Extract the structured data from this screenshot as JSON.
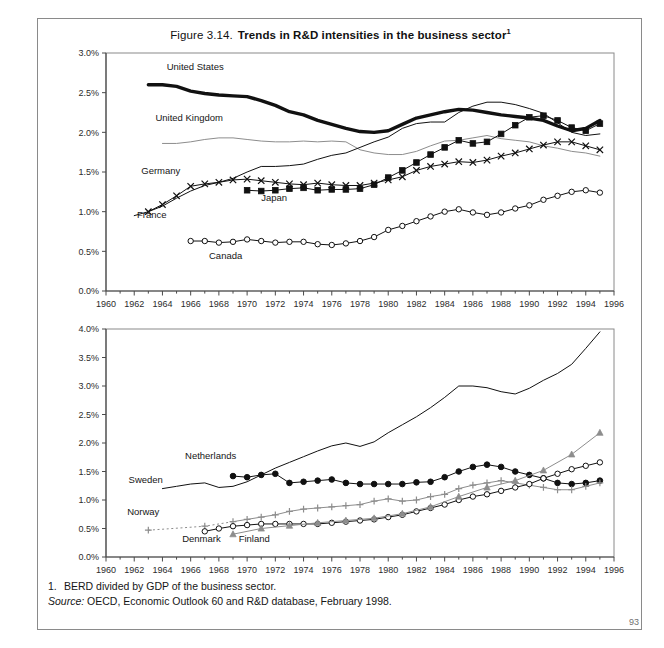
{
  "figure": {
    "number": "Figure 3.14.",
    "title": "Trends in R&D intensities in the business sector",
    "title_superscript": "1"
  },
  "footnotes": {
    "note_marker": "1.",
    "note_text": "BERD divided by GDP of the business sector.",
    "source_word": "Source:",
    "source_text": "OECD, Economic Outlook 60 and R&D database, February 1998."
  },
  "page_number": "93",
  "colors": {
    "axis": "#4a4a4a",
    "frame": "#8a8a8a",
    "black": "#111111",
    "gray": "#8d8d8d",
    "midgray": "#6e6e6e",
    "text": "#161616"
  },
  "chart_data": [
    {
      "type": "line",
      "id": "top-panel",
      "title": "Trends in R&D intensities in the business sector",
      "xlabel": "",
      "ylabel": "",
      "xlim": [
        1960,
        1996
      ],
      "ylim": [
        0.0,
        3.0
      ],
      "xticks": [
        1960,
        1962,
        1964,
        1966,
        1968,
        1970,
        1972,
        1974,
        1976,
        1978,
        1980,
        1982,
        1984,
        1986,
        1988,
        1990,
        1992,
        1994,
        1996
      ],
      "yticks": [
        "0.0%",
        "0.5%",
        "1.0%",
        "1.5%",
        "2.0%",
        "2.5%",
        "3.0%"
      ],
      "grid": false,
      "legend": "inline-annotations",
      "series": [
        {
          "name": "United States",
          "style": "thick-black-line",
          "marker": "none",
          "label_x": 1964.3,
          "label_y": 2.78,
          "x": [
            1963,
            1964,
            1965,
            1966,
            1967,
            1968,
            1969,
            1970,
            1971,
            1972,
            1973,
            1974,
            1975,
            1976,
            1977,
            1978,
            1979,
            1980,
            1981,
            1982,
            1983,
            1984,
            1985,
            1986,
            1987,
            1988,
            1989,
            1990,
            1991,
            1992,
            1993,
            1994,
            1995
          ],
          "values": [
            2.6,
            2.6,
            2.58,
            2.52,
            2.49,
            2.47,
            2.46,
            2.45,
            2.4,
            2.34,
            2.26,
            2.22,
            2.15,
            2.1,
            2.05,
            2.01,
            2.0,
            2.02,
            2.1,
            2.18,
            2.22,
            2.26,
            2.29,
            2.28,
            2.25,
            2.22,
            2.2,
            2.18,
            2.15,
            2.08,
            2.02,
            2.05,
            2.15
          ]
        },
        {
          "name": "United Kingdom",
          "style": "gray-line",
          "marker": "none",
          "label_x": 1963.5,
          "label_y": 2.14,
          "x": [
            1964,
            1965,
            1966,
            1967,
            1968,
            1969,
            1970,
            1971,
            1972,
            1973,
            1974,
            1975,
            1976,
            1977,
            1978,
            1979,
            1980,
            1981,
            1982,
            1983,
            1984,
            1985,
            1986,
            1987,
            1988,
            1989,
            1990,
            1991,
            1992,
            1993,
            1994,
            1995
          ],
          "values": [
            1.86,
            1.86,
            1.88,
            1.91,
            1.93,
            1.93,
            1.91,
            1.89,
            1.88,
            1.88,
            1.89,
            1.88,
            1.89,
            1.88,
            1.78,
            1.74,
            1.72,
            1.72,
            1.76,
            1.83,
            1.89,
            1.9,
            1.93,
            1.96,
            1.92,
            1.9,
            1.88,
            1.83,
            1.8,
            1.76,
            1.74,
            1.7
          ]
        },
        {
          "name": "Germany",
          "style": "thin-black-line",
          "marker": "none",
          "label_x": 1962.5,
          "label_y": 1.48,
          "x": [
            1962,
            1963,
            1964,
            1965,
            1966,
            1967,
            1968,
            1969,
            1970,
            1971,
            1972,
            1973,
            1974,
            1975,
            1976,
            1977,
            1978,
            1979,
            1980,
            1981,
            1982,
            1983,
            1984,
            1985,
            1986,
            1987,
            1988,
            1989,
            1990,
            1991,
            1992,
            1993,
            1994,
            1995
          ],
          "values": [
            0.95,
            1.0,
            1.07,
            1.17,
            1.26,
            1.33,
            1.37,
            1.42,
            1.5,
            1.57,
            1.57,
            1.58,
            1.6,
            1.66,
            1.71,
            1.74,
            1.81,
            1.88,
            1.94,
            2.05,
            2.11,
            2.13,
            2.13,
            2.25,
            2.33,
            2.38,
            2.38,
            2.35,
            2.3,
            2.24,
            2.12,
            2.0,
            1.96,
            1.98
          ]
        },
        {
          "name": "France",
          "style": "thin-black-line",
          "marker": "cross",
          "label_x": 1962.2,
          "label_y": 0.92,
          "x": [
            1963,
            1964,
            1965,
            1966,
            1967,
            1968,
            1969,
            1970,
            1971,
            1972,
            1973,
            1974,
            1975,
            1976,
            1977,
            1978,
            1979,
            1980,
            1981,
            1982,
            1983,
            1984,
            1985,
            1986,
            1987,
            1988,
            1989,
            1990,
            1991,
            1992,
            1993,
            1994,
            1995
          ],
          "values": [
            1.0,
            1.09,
            1.2,
            1.32,
            1.35,
            1.37,
            1.4,
            1.41,
            1.39,
            1.37,
            1.35,
            1.34,
            1.36,
            1.34,
            1.33,
            1.33,
            1.36,
            1.4,
            1.44,
            1.52,
            1.57,
            1.6,
            1.63,
            1.62,
            1.65,
            1.7,
            1.74,
            1.79,
            1.84,
            1.88,
            1.88,
            1.83,
            1.78
          ]
        },
        {
          "name": "Japan",
          "style": "thin-black-line",
          "marker": "filled-square",
          "label_x": 1971.0,
          "label_y": 1.13,
          "x": [
            1970,
            1971,
            1972,
            1973,
            1974,
            1975,
            1976,
            1977,
            1978,
            1979,
            1980,
            1981,
            1982,
            1983,
            1984,
            1985,
            1986,
            1987,
            1988,
            1989,
            1990,
            1991,
            1992,
            1993,
            1994,
            1995
          ],
          "values": [
            1.27,
            1.26,
            1.27,
            1.29,
            1.3,
            1.27,
            1.28,
            1.28,
            1.29,
            1.34,
            1.43,
            1.52,
            1.62,
            1.72,
            1.81,
            1.9,
            1.86,
            1.88,
            1.98,
            2.09,
            2.19,
            2.21,
            2.15,
            2.06,
            2.02,
            2.11
          ]
        },
        {
          "name": "Canada",
          "style": "thin-black-line",
          "marker": "open-circle",
          "label_x": 1967.3,
          "label_y": 0.4,
          "x": [
            1966,
            1967,
            1968,
            1969,
            1970,
            1971,
            1972,
            1973,
            1974,
            1975,
            1976,
            1977,
            1978,
            1979,
            1980,
            1981,
            1982,
            1983,
            1984,
            1985,
            1986,
            1987,
            1988,
            1989,
            1990,
            1991,
            1992,
            1993,
            1994,
            1995
          ],
          "values": [
            0.63,
            0.63,
            0.61,
            0.62,
            0.65,
            0.63,
            0.61,
            0.62,
            0.62,
            0.59,
            0.58,
            0.6,
            0.63,
            0.68,
            0.77,
            0.82,
            0.88,
            0.94,
            1.0,
            1.03,
            0.99,
            0.96,
            0.99,
            1.04,
            1.08,
            1.15,
            1.2,
            1.25,
            1.27,
            1.24
          ]
        }
      ]
    },
    {
      "type": "line",
      "id": "bottom-panel",
      "title": "",
      "xlabel": "",
      "ylabel": "",
      "xlim": [
        1960,
        1996
      ],
      "ylim": [
        0.0,
        4.0
      ],
      "xticks": [
        1960,
        1962,
        1964,
        1966,
        1968,
        1970,
        1972,
        1974,
        1976,
        1978,
        1980,
        1982,
        1984,
        1986,
        1988,
        1990,
        1992,
        1994,
        1996
      ],
      "yticks": [
        "0.0%",
        "0.5%",
        "1.0%",
        "1.5%",
        "2.0%",
        "2.5%",
        "3.0%",
        "3.5%",
        "4.0%"
      ],
      "grid": false,
      "legend": "inline-annotations",
      "series": [
        {
          "name": "Sweden",
          "style": "thin-black-line",
          "marker": "none",
          "label_x": 1961.6,
          "label_y": 1.3,
          "x": [
            1964,
            1965,
            1966,
            1967,
            1968,
            1969,
            1970,
            1971,
            1972,
            1973,
            1974,
            1975,
            1976,
            1977,
            1978,
            1979,
            1980,
            1981,
            1982,
            1983,
            1984,
            1985,
            1986,
            1987,
            1988,
            1989,
            1990,
            1991,
            1992,
            1993,
            1994,
            1995
          ],
          "values": [
            1.2,
            1.24,
            1.28,
            1.3,
            1.22,
            1.24,
            1.32,
            1.44,
            1.56,
            1.66,
            1.76,
            1.86,
            1.95,
            2.0,
            1.94,
            2.02,
            2.18,
            2.32,
            2.46,
            2.62,
            2.8,
            3.0,
            3.0,
            2.97,
            2.9,
            2.86,
            2.96,
            3.1,
            3.22,
            3.38,
            3.66,
            3.95
          ]
        },
        {
          "name": "Netherlands",
          "style": "thin-black-line",
          "marker": "filled-circle",
          "label_x": 1965.6,
          "label_y": 1.72,
          "x": [
            1969,
            1970,
            1971,
            1972,
            1973,
            1974,
            1975,
            1976,
            1977,
            1978,
            1979,
            1980,
            1981,
            1982,
            1983,
            1984,
            1985,
            1986,
            1987,
            1988,
            1989,
            1990,
            1991,
            1992,
            1993,
            1994,
            1995
          ],
          "values": [
            1.42,
            1.4,
            1.44,
            1.46,
            1.3,
            1.32,
            1.34,
            1.36,
            1.3,
            1.28,
            1.28,
            1.28,
            1.28,
            1.31,
            1.32,
            1.4,
            1.5,
            1.58,
            1.62,
            1.58,
            1.5,
            1.44,
            1.38,
            1.3,
            1.28,
            1.3,
            1.34
          ]
        },
        {
          "name": "Norway",
          "style": "gray-line",
          "marker": "plus",
          "label_x": 1961.5,
          "label_y": 0.74,
          "dotted_until": 1969,
          "x": [
            1963,
            1967,
            1969,
            1970,
            1971,
            1972,
            1973,
            1974,
            1975,
            1976,
            1977,
            1978,
            1979,
            1980,
            1981,
            1982,
            1983,
            1984,
            1985,
            1986,
            1987,
            1988,
            1989,
            1990,
            1991,
            1992,
            1993,
            1994,
            1995
          ],
          "values": [
            0.47,
            0.54,
            0.62,
            0.66,
            0.7,
            0.74,
            0.8,
            0.84,
            0.86,
            0.88,
            0.9,
            0.92,
            0.98,
            1.02,
            0.98,
            1.0,
            1.06,
            1.1,
            1.2,
            1.26,
            1.3,
            1.34,
            1.3,
            1.26,
            1.22,
            1.18,
            1.18,
            1.24,
            1.3
          ]
        },
        {
          "name": "Denmark",
          "style": "thin-black-line",
          "marker": "open-circle",
          "label_x": 1965.4,
          "label_y": 0.27,
          "x": [
            1967,
            1968,
            1969,
            1970,
            1971,
            1972,
            1973,
            1974,
            1975,
            1976,
            1977,
            1978,
            1979,
            1980,
            1981,
            1982,
            1983,
            1984,
            1985,
            1986,
            1987,
            1988,
            1989,
            1990,
            1991,
            1992,
            1993,
            1994,
            1995
          ],
          "values": [
            0.45,
            0.5,
            0.54,
            0.56,
            0.58,
            0.58,
            0.58,
            0.58,
            0.58,
            0.6,
            0.62,
            0.64,
            0.66,
            0.7,
            0.74,
            0.8,
            0.86,
            0.92,
            1.0,
            1.06,
            1.1,
            1.16,
            1.22,
            1.28,
            1.38,
            1.46,
            1.54,
            1.6,
            1.66
          ]
        },
        {
          "name": "Finland",
          "style": "gray-line",
          "marker": "filled-triangle",
          "label_x": 1969.4,
          "label_y": 0.27,
          "x": [
            1969,
            1971,
            1973,
            1975,
            1977,
            1979,
            1981,
            1983,
            1985,
            1987,
            1989,
            1991,
            1993,
            1995
          ],
          "values": [
            0.4,
            0.5,
            0.55,
            0.6,
            0.64,
            0.68,
            0.76,
            0.88,
            1.06,
            1.22,
            1.34,
            1.52,
            1.8,
            2.18
          ]
        }
      ]
    }
  ]
}
